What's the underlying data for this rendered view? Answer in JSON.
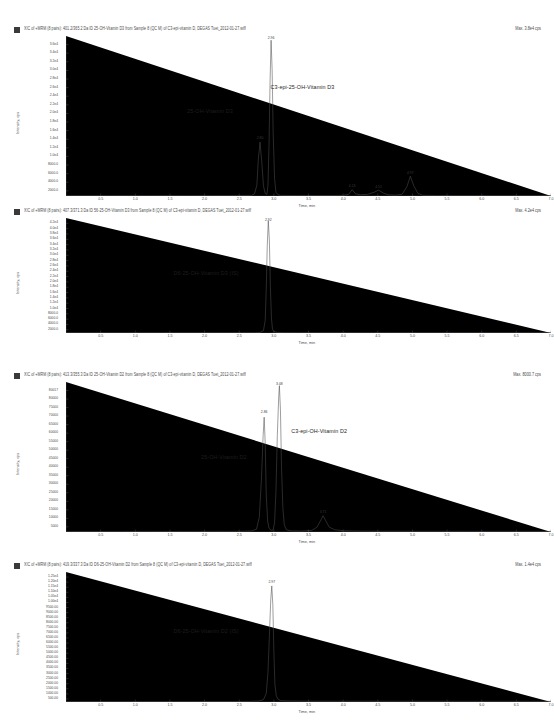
{
  "document": {
    "title": "XIC chromatograms of vitamin D metabolites",
    "axis_x_label": "Time, min",
    "axis_y_label": "Intensity, cps"
  },
  "chart_data": [
    {
      "type": "line",
      "panel_index": 1,
      "header": "XIC of +MRM (8 pairs): 401.2/365.2 Da ID 25-OH-Vitamin D3 from Sample 8 (QC M) of C3-epi-vitamin D, DEGAS Tuet_2012-01-27.wiff",
      "max_label": "Max. 3.8e4 cps",
      "title": "",
      "xlabel": "Time, min",
      "ylabel": "Intensity, cps",
      "xlim": [
        0.0,
        7.0
      ],
      "ylim": [
        0,
        38000
      ],
      "xticks": [
        "0.5",
        "1.0",
        "1.5",
        "2.0",
        "2.5",
        "3.0",
        "3.5",
        "4.0",
        "4.5",
        "5.0",
        "5.5",
        "6.0",
        "6.5",
        "7.0"
      ],
      "yticks": [
        "3.6e4",
        "3.4e4",
        "3.2e4",
        "3.0e4",
        "2.8e4",
        "2.6e4",
        "2.4e4",
        "2.2e4",
        "2.0e4",
        "1.8e4",
        "1.6e4",
        "1.4e4",
        "1.2e4",
        "1.0e4",
        "8000.0",
        "6000.0",
        "4000.0",
        "2000.0"
      ],
      "annotations": [
        {
          "text": "25-OH-Vitamin D3",
          "x": 1.75,
          "y": 21000
        },
        {
          "text": "C3-epi-25-OH-Vitamin D3",
          "x": 2.95,
          "y": 26500
        }
      ],
      "peaks": [
        {
          "label": "2.80",
          "x": 2.8,
          "y": 13000
        },
        {
          "label": "2.96",
          "x": 2.96,
          "y": 37000
        },
        {
          "label": "4.13",
          "x": 4.13,
          "y": 1600
        },
        {
          "label": "4.51",
          "x": 4.51,
          "y": 1500
        },
        {
          "label": "4.97",
          "x": 4.97,
          "y": 4800
        }
      ],
      "points": [
        [
          0.0,
          60
        ],
        [
          0.3,
          70
        ],
        [
          0.6,
          65
        ],
        [
          0.9,
          80
        ],
        [
          1.2,
          70
        ],
        [
          1.5,
          75
        ],
        [
          1.8,
          70
        ],
        [
          2.1,
          80
        ],
        [
          2.35,
          90
        ],
        [
          2.55,
          110
        ],
        [
          2.68,
          160
        ],
        [
          2.72,
          500
        ],
        [
          2.755,
          2600
        ],
        [
          2.775,
          8500
        ],
        [
          2.8,
          12800
        ],
        [
          2.825,
          8200
        ],
        [
          2.85,
          2400
        ],
        [
          2.875,
          600
        ],
        [
          2.9,
          400
        ],
        [
          2.915,
          2500
        ],
        [
          2.93,
          12000
        ],
        [
          2.945,
          27000
        ],
        [
          2.96,
          37000
        ],
        [
          2.975,
          30000
        ],
        [
          2.99,
          15000
        ],
        [
          3.01,
          4200
        ],
        [
          3.03,
          900
        ],
        [
          3.06,
          300
        ],
        [
          3.1,
          150
        ],
        [
          3.25,
          110
        ],
        [
          3.45,
          100
        ],
        [
          3.65,
          110
        ],
        [
          3.85,
          120
        ],
        [
          4.0,
          160
        ],
        [
          4.08,
          400
        ],
        [
          4.13,
          1500
        ],
        [
          4.18,
          500
        ],
        [
          4.25,
          300
        ],
        [
          4.35,
          380
        ],
        [
          4.45,
          900
        ],
        [
          4.51,
          1400
        ],
        [
          4.58,
          700
        ],
        [
          4.65,
          300
        ],
        [
          4.75,
          200
        ],
        [
          4.85,
          400
        ],
        [
          4.92,
          2200
        ],
        [
          4.97,
          4700
        ],
        [
          5.02,
          2400
        ],
        [
          5.08,
          600
        ],
        [
          5.15,
          180
        ],
        [
          5.35,
          100
        ],
        [
          5.6,
          90
        ],
        [
          5.9,
          85
        ],
        [
          6.2,
          80
        ],
        [
          6.5,
          80
        ],
        [
          6.8,
          75
        ],
        [
          7.0,
          70
        ]
      ]
    },
    {
      "type": "line",
      "panel_index": 2,
      "header": "XIC of +MRM (8 pairs): 407.3/371.3 Da ID 56-25-OH-Vitamin D3 from Sample 8 (QC M) of C3-epi-vitamin D, DEGAS Tuet_2012-01-27.wiff",
      "max_label": "Max. 4.2e4 cps",
      "title": "",
      "xlabel": "Time, min",
      "ylabel": "Intensity, cps",
      "xlim": [
        0.0,
        7.0
      ],
      "ylim": [
        0,
        42000
      ],
      "xticks": [
        "0.5",
        "1.0",
        "1.5",
        "2.0",
        "2.5",
        "3.0",
        "3.5",
        "4.0",
        "4.5",
        "5.0",
        "5.5",
        "6.0",
        "6.5",
        "7.0"
      ],
      "yticks": [
        "4.2e4",
        "4.0e4",
        "3.8e4",
        "3.6e4",
        "3.4e4",
        "3.2e4",
        "3.0e4",
        "2.8e4",
        "2.6e4",
        "2.4e4",
        "2.2e4",
        "2.0e4",
        "1.8e4",
        "1.6e4",
        "1.4e4",
        "1.2e4",
        "1.0e4",
        "8000.0",
        "6000.0",
        "4000.0",
        "2000.0"
      ],
      "annotations": [
        {
          "text": "D6-25-OH-Vitamin D3 (IS)",
          "x": 1.55,
          "y": 23000
        }
      ],
      "peaks": [
        {
          "label": "2.92",
          "x": 2.92,
          "y": 41000
        }
      ],
      "points": [
        [
          0.0,
          60
        ],
        [
          0.4,
          65
        ],
        [
          0.8,
          60
        ],
        [
          1.2,
          70
        ],
        [
          1.6,
          65
        ],
        [
          2.0,
          70
        ],
        [
          2.4,
          75
        ],
        [
          2.6,
          85
        ],
        [
          2.72,
          110
        ],
        [
          2.8,
          200
        ],
        [
          2.85,
          900
        ],
        [
          2.875,
          4500
        ],
        [
          2.89,
          16000
        ],
        [
          2.905,
          32000
        ],
        [
          2.92,
          41000
        ],
        [
          2.935,
          34000
        ],
        [
          2.95,
          17000
        ],
        [
          2.965,
          5500
        ],
        [
          2.98,
          1400
        ],
        [
          3.0,
          500
        ],
        [
          3.05,
          200
        ],
        [
          3.15,
          120
        ],
        [
          3.4,
          95
        ],
        [
          3.8,
          90
        ],
        [
          4.2,
          85
        ],
        [
          4.6,
          90
        ],
        [
          5.0,
          85
        ],
        [
          5.5,
          80
        ],
        [
          6.0,
          80
        ],
        [
          6.5,
          75
        ],
        [
          7.0,
          70
        ]
      ]
    },
    {
      "type": "line",
      "panel_index": 3,
      "header": "XIC of +MRM (8 pairs): 413.3/355.3 Da ID 25-OH-Vitamin D2 from Sample 8 (QC M) of C3-epi-vitamin D, DEGAS Tuet_2012-01-27.wiff",
      "max_label": "Max. 8000.7 cps",
      "title": "",
      "xlabel": "Time, min",
      "ylabel": "Intensity, cps",
      "xlim": [
        0.0,
        7.0
      ],
      "ylim": [
        0,
        81000
      ],
      "xticks": [
        "0.5",
        "1.0",
        "1.5",
        "2.0",
        "2.5",
        "3.0",
        "3.5",
        "4.0",
        "4.5",
        "5.0",
        "5.5",
        "6.0",
        "6.5",
        "7.0"
      ],
      "yticks": [
        "80017",
        "80000",
        "75000",
        "70000",
        "65000",
        "60000",
        "55000",
        "50000",
        "45000",
        "40000",
        "35000",
        "30000",
        "25000",
        "20000",
        "15000",
        "10000",
        "5000"
      ],
      "annotations": [
        {
          "text": "25-OH-Vitamin D2",
          "x": 1.95,
          "y": 42000
        },
        {
          "text": "C3-epi-OH-Vitamin D2",
          "x": 3.25,
          "y": 56000
        }
      ],
      "peaks": [
        {
          "label": "2.86",
          "x": 2.86,
          "y": 63000
        },
        {
          "label": "3.08",
          "x": 3.08,
          "y": 79000
        },
        {
          "label": "3.71",
          "x": 3.71,
          "y": 9000
        }
      ],
      "points": [
        [
          0.0,
          300
        ],
        [
          0.4,
          320
        ],
        [
          0.8,
          300
        ],
        [
          1.2,
          330
        ],
        [
          1.6,
          310
        ],
        [
          2.0,
          340
        ],
        [
          2.3,
          360
        ],
        [
          2.55,
          420
        ],
        [
          2.68,
          600
        ],
        [
          2.75,
          1500
        ],
        [
          2.79,
          8000
        ],
        [
          2.82,
          28000
        ],
        [
          2.845,
          52000
        ],
        [
          2.86,
          62000
        ],
        [
          2.875,
          48000
        ],
        [
          2.89,
          20000
        ],
        [
          2.91,
          6000
        ],
        [
          2.93,
          2000
        ],
        [
          2.96,
          900
        ],
        [
          2.99,
          1200
        ],
        [
          3.01,
          5000
        ],
        [
          3.03,
          22000
        ],
        [
          3.05,
          52000
        ],
        [
          3.07,
          73000
        ],
        [
          3.08,
          79000
        ],
        [
          3.095,
          66000
        ],
        [
          3.11,
          36000
        ],
        [
          3.13,
          13000
        ],
        [
          3.15,
          4000
        ],
        [
          3.18,
          1200
        ],
        [
          3.25,
          600
        ],
        [
          3.4,
          500
        ],
        [
          3.55,
          900
        ],
        [
          3.62,
          2500
        ],
        [
          3.68,
          6500
        ],
        [
          3.71,
          8800
        ],
        [
          3.75,
          6000
        ],
        [
          3.8,
          2600
        ],
        [
          3.88,
          1200
        ],
        [
          4.0,
          700
        ],
        [
          4.2,
          500
        ],
        [
          4.5,
          420
        ],
        [
          4.9,
          400
        ],
        [
          5.3,
          380
        ],
        [
          5.8,
          360
        ],
        [
          6.3,
          350
        ],
        [
          6.8,
          340
        ],
        [
          7.0,
          330
        ]
      ]
    },
    {
      "type": "line",
      "panel_index": 4,
      "header": "XIC of +MRM (8 pairs): 419.3/337.3 Da ID D6-25-OH-Vitamin D2 from Sample 8 (QC M) of C3-epi-vitamin D, DEGAS Tuet_2012-01-27.wiff",
      "max_label": "Max. 1.4e4 cps",
      "title": "",
      "xlabel": "Time, min",
      "ylabel": "Intensity, cps",
      "xlim": [
        0.0,
        7.0
      ],
      "ylim": [
        0,
        14000
      ],
      "xticks": [
        "0.5",
        "1.0",
        "1.5",
        "2.0",
        "2.5",
        "3.0",
        "3.5",
        "4.0",
        "4.5",
        "5.0",
        "5.5",
        "6.0",
        "6.5",
        "7.0"
      ],
      "yticks": [
        "1.25e4",
        "1.20e4",
        "1.15e4",
        "1.10e4",
        "1.05e4",
        "1.00e4",
        "9500.00",
        "9000.00",
        "8500.00",
        "8000.00",
        "7500.00",
        "7000.00",
        "6500.00",
        "6000.00",
        "5500.00",
        "5000.00",
        "4500.00",
        "4000.00",
        "3500.00",
        "3000.00",
        "2500.00",
        "2000.00",
        "1500.00",
        "1000.00",
        "500.00"
      ],
      "annotations": [
        {
          "text": "D6-25-OH-Vitamin D2 (IS)",
          "x": 1.55,
          "y": 8000
        }
      ],
      "peaks": [
        {
          "label": "2.97",
          "x": 2.97,
          "y": 12600
        }
      ],
      "points": [
        [
          0.0,
          40
        ],
        [
          0.4,
          45
        ],
        [
          0.8,
          40
        ],
        [
          1.2,
          50
        ],
        [
          1.6,
          45
        ],
        [
          2.0,
          50
        ],
        [
          2.4,
          55
        ],
        [
          2.65,
          70
        ],
        [
          2.78,
          110
        ],
        [
          2.85,
          250
        ],
        [
          2.89,
          900
        ],
        [
          2.915,
          3200
        ],
        [
          2.935,
          7000
        ],
        [
          2.955,
          11000
        ],
        [
          2.97,
          12500
        ],
        [
          2.985,
          10500
        ],
        [
          3.0,
          5500
        ],
        [
          3.015,
          1900
        ],
        [
          3.035,
          700
        ],
        [
          3.06,
          300
        ],
        [
          3.1,
          150
        ],
        [
          3.25,
          110
        ],
        [
          3.5,
          90
        ],
        [
          3.9,
          85
        ],
        [
          4.3,
          85
        ],
        [
          4.8,
          80
        ],
        [
          5.4,
          80
        ],
        [
          6.0,
          75
        ],
        [
          6.5,
          75
        ],
        [
          7.0,
          70
        ]
      ]
    }
  ]
}
